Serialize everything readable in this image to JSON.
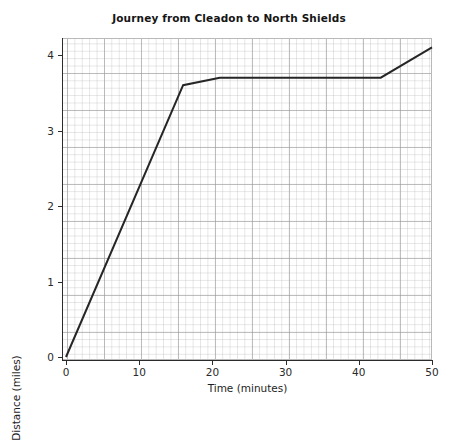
{
  "chart_data": {
    "type": "line",
    "title": "Journey from Cleadon to North Shields",
    "xlabel": "Time (minutes)",
    "ylabel": "Distance (miles)",
    "xlim": [
      0,
      50
    ],
    "ylim": [
      0,
      4.3
    ],
    "xticks": [
      0,
      10,
      20,
      30,
      40,
      50
    ],
    "xtick_labels": [
      "0",
      "10",
      "20",
      "30",
      "40",
      "50"
    ],
    "yticks": [
      0,
      1,
      2,
      3,
      4
    ],
    "ytick_labels": [
      "0",
      "1",
      "2",
      "3",
      "4"
    ],
    "grid": true,
    "grid_major_x": 5,
    "grid_major_y": 0.5,
    "grid_minor_x": 1,
    "grid_minor_y": 0.1,
    "legend": null,
    "series": [
      {
        "name": "Journey",
        "color": "#262626",
        "line_width": 2,
        "x": [
          0,
          16,
          21,
          43,
          50
        ],
        "y": [
          0,
          3.6,
          3.7,
          3.7,
          4.1
        ],
        "points": [
          {
            "t": 0,
            "d": 0
          },
          {
            "t": 16,
            "d": 3.6
          },
          {
            "t": 21,
            "d": 3.7
          },
          {
            "t": 43,
            "d": 3.7
          },
          {
            "t": 50,
            "d": 4.1
          }
        ]
      }
    ],
    "annotations": []
  },
  "colors": {
    "line": "#262626",
    "axis": "#2b2b2b",
    "grid_major": "#969696",
    "grid_minor": "#aaaaaa",
    "plot_border": "#b9b9b9",
    "background": "#ffffff",
    "text": "#1a1a1a"
  }
}
